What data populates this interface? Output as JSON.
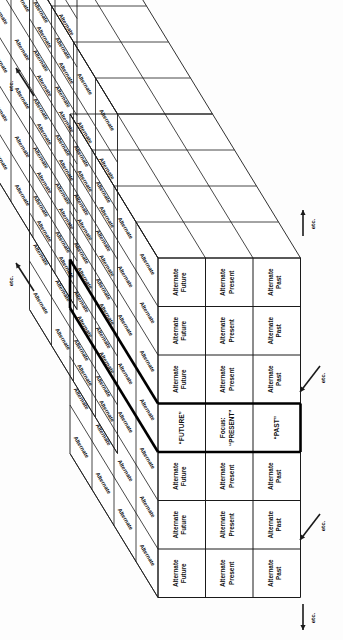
{
  "diagram": {
    "orientation": "rotated-90-ccw",
    "columns": [
      {
        "key": "future",
        "normal_label_line1": "Alternate",
        "normal_label_line2": "Future",
        "focus_line1": "",
        "focus_line2": "“FUTURE”"
      },
      {
        "key": "present",
        "normal_label_line1": "Alternate",
        "normal_label_line2": "Present",
        "focus_line1": "Focus:",
        "focus_line2": "“PRESENT”"
      },
      {
        "key": "past",
        "normal_label_line1": "Alternate",
        "normal_label_line2": "Past",
        "focus_line1": "",
        "focus_line2": "“PAST”"
      }
    ],
    "rows": [
      {
        "index": 0,
        "focus": false
      },
      {
        "index": 1,
        "focus": false
      },
      {
        "index": 2,
        "focus": false
      },
      {
        "index": 3,
        "focus": true
      },
      {
        "index": 4,
        "focus": false
      },
      {
        "index": 5,
        "focus": false
      },
      {
        "index": 6,
        "focus": false
      }
    ],
    "side_label": "Alternate",
    "etc_label": "etc.",
    "etc_markers": [
      {
        "id": "etc-top-left",
        "direction": "diagonal-up-left"
      },
      {
        "id": "etc-mid-left",
        "direction": "diagonal-up-left"
      },
      {
        "id": "etc-top-right",
        "direction": "up"
      },
      {
        "id": "etc-mid-right",
        "direction": "diagonal-down-left"
      },
      {
        "id": "etc-low-right",
        "direction": "diagonal-down-left"
      },
      {
        "id": "etc-bottom-right",
        "direction": "down"
      }
    ],
    "colors": {
      "line": "#1a1a1a",
      "bold_line": "#000000",
      "background": "#fdfdfd",
      "text": "#111111"
    }
  }
}
